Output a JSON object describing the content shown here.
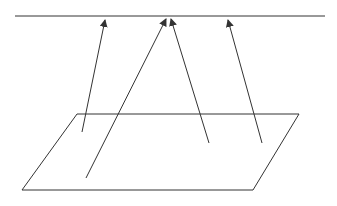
{
  "diagram": {
    "stroke_color": "#333333",
    "background": "#ffffff",
    "top_line": {
      "x1": 15,
      "y1": 16,
      "x2": 325,
      "y2": 16
    },
    "plane": {
      "points": "77,114 299,114 253,190 22,190"
    },
    "arrows": [
      {
        "x1": 82,
        "y1": 132,
        "x2": 105,
        "y2": 20
      },
      {
        "x1": 86,
        "y1": 178,
        "x2": 166,
        "y2": 19
      },
      {
        "x1": 209,
        "y1": 143,
        "x2": 171,
        "y2": 19
      },
      {
        "x1": 262,
        "y1": 143,
        "x2": 228,
        "y2": 20
      }
    ]
  }
}
